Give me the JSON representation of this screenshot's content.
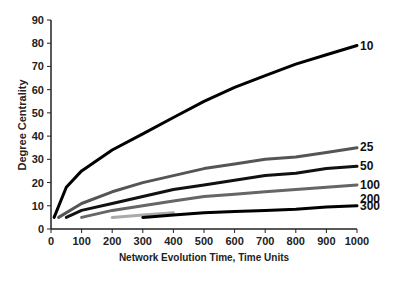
{
  "chart_data": {
    "type": "line",
    "title": "",
    "xlabel": "Network Evolution Time, Time Units",
    "ylabel": "Degree Centrality",
    "xlim": [
      0,
      1000
    ],
    "ylim": [
      0,
      90
    ],
    "x_ticks": [
      0,
      100,
      200,
      300,
      400,
      500,
      600,
      700,
      800,
      900,
      1000
    ],
    "y_ticks": [
      0,
      10,
      20,
      30,
      40,
      50,
      60,
      70,
      80,
      90
    ],
    "grid": false,
    "legend": "inline labels at line ends",
    "series": [
      {
        "name": "10",
        "color": "#000000",
        "x": [
          10,
          50,
          100,
          200,
          300,
          400,
          500,
          600,
          700,
          800,
          900,
          1000
        ],
        "y": [
          5,
          18,
          25,
          34,
          41,
          48,
          55,
          61,
          66,
          71,
          75,
          79
        ]
      },
      {
        "name": "25",
        "color": "#555555",
        "x": [
          25,
          100,
          200,
          300,
          400,
          500,
          600,
          700,
          800,
          900,
          1000
        ],
        "y": [
          5,
          11,
          16,
          20,
          23,
          26,
          28,
          30,
          31,
          33,
          35
        ]
      },
      {
        "name": "50",
        "color": "#111111",
        "x": [
          50,
          100,
          200,
          300,
          400,
          500,
          600,
          700,
          800,
          900,
          1000
        ],
        "y": [
          5,
          8,
          11,
          14,
          17,
          19,
          21,
          23,
          24,
          26,
          27
        ]
      },
      {
        "name": "100",
        "color": "#666666",
        "x": [
          100,
          200,
          300,
          400,
          500,
          600,
          700,
          800,
          900,
          1000
        ],
        "y": [
          5,
          8,
          10,
          12,
          14,
          15,
          16,
          17,
          18,
          19
        ]
      },
      {
        "name": "200",
        "color": "#aaaaaa",
        "x": [
          200,
          300,
          400
        ],
        "y": [
          5,
          6,
          7
        ]
      },
      {
        "name": "300",
        "color": "#000000",
        "x": [
          300,
          400,
          500,
          600,
          700,
          800,
          900,
          1000
        ],
        "y": [
          5,
          6,
          7,
          7.5,
          8,
          8.5,
          9.5,
          10
        ]
      }
    ]
  }
}
